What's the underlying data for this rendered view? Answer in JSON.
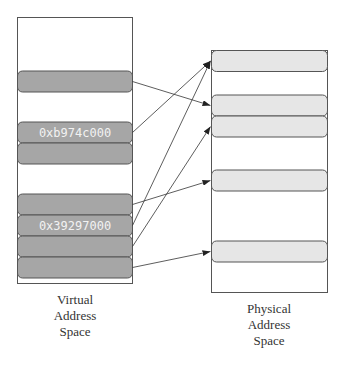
{
  "virtual": {
    "caption": [
      "Virtual",
      "Address",
      "Space"
    ],
    "slots": [
      {
        "id": "v0",
        "label": ""
      },
      {
        "id": "v1",
        "label": "0xb974c000"
      },
      {
        "id": "v2",
        "label": ""
      },
      {
        "id": "v3",
        "label": ""
      },
      {
        "id": "v4",
        "label": "0x39297000"
      },
      {
        "id": "v5",
        "label": ""
      },
      {
        "id": "v6",
        "label": ""
      }
    ],
    "fill_color": "#a6a6a6"
  },
  "physical": {
    "caption": [
      "Physical",
      "Address",
      "Space"
    ],
    "slots": [
      {
        "id": "p0"
      },
      {
        "id": "p1"
      },
      {
        "id": "p2"
      },
      {
        "id": "p3"
      },
      {
        "id": "p4"
      }
    ],
    "fill_color": "#e6e6e6"
  },
  "mappings": [
    {
      "from": "v0",
      "to": "p1"
    },
    {
      "from": "v1",
      "to": "p0"
    },
    {
      "from": "v3",
      "to": "p3"
    },
    {
      "from": "v4",
      "to": "p0"
    },
    {
      "from": "v5",
      "to": "p2"
    },
    {
      "from": "v6",
      "to": "p4"
    }
  ]
}
